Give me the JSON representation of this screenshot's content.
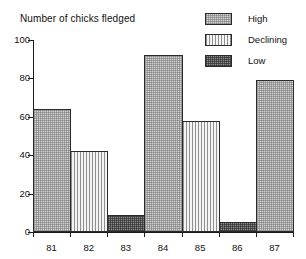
{
  "chart_data": {
    "type": "bar",
    "title": "Number of chicks fledged",
    "xlabel": "",
    "ylabel": "Number of chicks fledged",
    "categories": [
      "81",
      "82",
      "83",
      "84",
      "85",
      "86",
      "87"
    ],
    "values": [
      64,
      42,
      9,
      92,
      58,
      5,
      79
    ],
    "point_categories": [
      "High",
      "Declining",
      "Low",
      "High",
      "Declining",
      "Low",
      "High"
    ],
    "ylim": [
      0,
      100
    ],
    "yticks": [
      0,
      20,
      40,
      60,
      80,
      100
    ],
    "ytick_labels": [
      "0",
      "20",
      "40",
      "60",
      "80",
      "100"
    ],
    "grid": false,
    "legend_position": "top-right",
    "legend": [
      {
        "label": "High",
        "pattern": "light-checker",
        "color": "#d2d2d2"
      },
      {
        "label": "Declining",
        "pattern": "vertical-stripes",
        "color": "#f0f0f0"
      },
      {
        "label": "Low",
        "pattern": "dark-checker",
        "color": "#8d8d8d"
      }
    ],
    "bars": [
      {
        "category": "81",
        "value": 64,
        "series": "High"
      },
      {
        "category": "82",
        "value": 42,
        "series": "Declining"
      },
      {
        "category": "83",
        "value": 9,
        "series": "Low"
      },
      {
        "category": "84",
        "value": 92,
        "series": "High"
      },
      {
        "category": "85",
        "value": 58,
        "series": "Declining"
      },
      {
        "category": "86",
        "value": 5,
        "series": "Low"
      },
      {
        "category": "87",
        "value": 79,
        "series": "High"
      }
    ]
  }
}
